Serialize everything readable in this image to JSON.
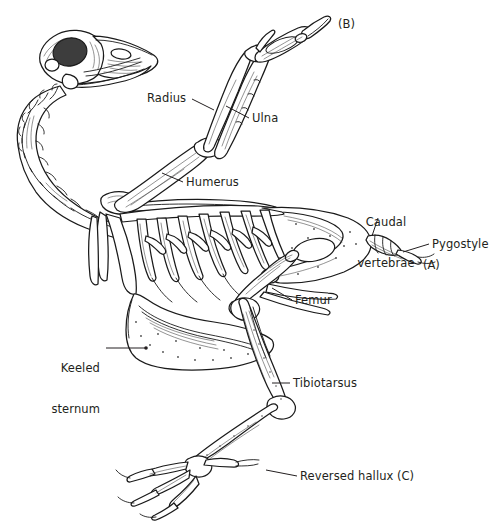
{
  "figure": {
    "background_color": "#ffffff",
    "ink_color": "#1a1a1a",
    "text_color": "#231f20",
    "width": 501,
    "height": 532
  },
  "labels": [
    {
      "id": "radius",
      "text": "Radius",
      "align": "left",
      "x": 147,
      "y": 92,
      "leader": {
        "x1": 192,
        "y1": 99,
        "x2": 214,
        "y2": 110
      }
    },
    {
      "id": "ulna",
      "text": "Ulna",
      "align": "left",
      "x": 252,
      "y": 112,
      "leader": {
        "x1": 249,
        "y1": 118,
        "x2": 226,
        "y2": 106
      }
    },
    {
      "id": "humerus",
      "text": "Humerus",
      "align": "left",
      "x": 186,
      "y": 176,
      "leader": {
        "x1": 183,
        "y1": 182,
        "x2": 162,
        "y2": 173
      }
    },
    {
      "id": "caudal-vertebrae",
      "text_line1": "Caudal",
      "text_line2": "vertebrae",
      "align": "center",
      "x": 360,
      "y": 189,
      "leader": {
        "x1": 378,
        "y1": 218,
        "x2": 372,
        "y2": 236
      }
    },
    {
      "id": "pygostyle",
      "text": "Pygostyle",
      "align": "left",
      "x": 432,
      "y": 238,
      "leader": {
        "x1": 429,
        "y1": 244,
        "x2": 403,
        "y2": 252
      }
    },
    {
      "id": "femur",
      "text": "Femur",
      "align": "left",
      "x": 295,
      "y": 294,
      "leader": {
        "x1": 292,
        "y1": 300,
        "x2": 272,
        "y2": 288
      }
    },
    {
      "id": "keeled-sternum",
      "text_line1": "Keeled",
      "text_line2": "sternum",
      "align": "right",
      "x": 45,
      "y": 335,
      "leader": {
        "x1": 106,
        "y1": 348,
        "x2": 146,
        "y2": 348
      }
    },
    {
      "id": "tibiotarsus",
      "text": "Tibiotarsus",
      "align": "left",
      "x": 293,
      "y": 377,
      "leader": {
        "x1": 290,
        "y1": 383,
        "x2": 272,
        "y2": 383
      }
    },
    {
      "id": "reversed-hallux",
      "text": "Reversed hallux",
      "align": "left",
      "x": 300,
      "y": 470,
      "leader": {
        "x1": 297,
        "y1": 476,
        "x2": 268,
        "y2": 471
      }
    }
  ],
  "panel_tags": [
    {
      "id": "panel-b",
      "text": "(B)",
      "x": 338,
      "y": 18
    },
    {
      "id": "panel-a",
      "text": "(A)",
      "x": 423,
      "y": 259
    },
    {
      "id": "panel-c",
      "text": "(C)",
      "x": 397,
      "y": 470
    }
  ],
  "anatomy_parts": [
    "skull",
    "beak",
    "orbit",
    "cervical-vertebrae",
    "furcula",
    "coracoid",
    "scapula",
    "humerus",
    "radius",
    "ulna",
    "carpometacarpus",
    "manus-digits",
    "ribs",
    "uncinate-processes",
    "keeled-sternum",
    "synsacrum",
    "ilium",
    "caudal-vertebrae",
    "pygostyle",
    "femur",
    "tibiotarsus",
    "fibula",
    "tarsometatarsus",
    "toes",
    "reversed-hallux"
  ]
}
